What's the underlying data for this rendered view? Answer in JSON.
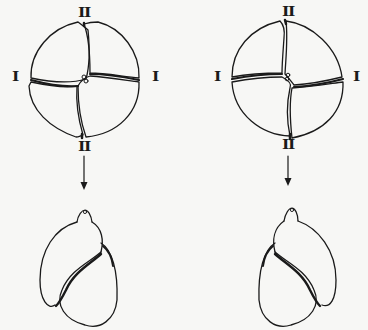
{
  "diagram": {
    "type": "embryo-cleavage-to-shell-coiling",
    "panels": [
      {
        "id": "left",
        "embryo": {
          "stage": "4-cell",
          "labels": {
            "top": "II",
            "bottom": "II",
            "left": "I",
            "right": "I"
          }
        },
        "arrow": "down",
        "shell": {
          "coiling": "left-opening aperture"
        }
      },
      {
        "id": "right",
        "embryo": {
          "stage": "4-cell",
          "labels": {
            "top": "II",
            "bottom": "II",
            "left": "I",
            "right": "I"
          }
        },
        "arrow": "down",
        "shell": {
          "coiling": "right-opening aperture"
        }
      }
    ],
    "colors": {
      "background": "#f7f7f5",
      "ink": "#1a1a1a"
    }
  }
}
